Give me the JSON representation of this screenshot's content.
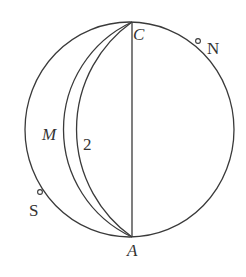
{
  "diagram": {
    "type": "sphere-great-circle-construction",
    "colors": {
      "line": "#3a3a3a",
      "text": "#333333",
      "background": "#ffffff"
    },
    "outer_circle": {
      "cx": 130,
      "cy": 129.5,
      "r": 106
    },
    "points": {
      "C": {
        "label": "C",
        "x": 132,
        "y": 22,
        "italic": true
      },
      "A": {
        "label": "A",
        "x": 132,
        "y": 237,
        "italic": true
      },
      "N": {
        "label": "N",
        "x": 198,
        "y": 41,
        "italic": false,
        "marker": "small-circle"
      },
      "S": {
        "label": "S",
        "x": 40,
        "y": 192,
        "italic": false,
        "marker": "small-circle"
      }
    },
    "segments": [
      {
        "name": "CA",
        "from": "C",
        "to": "A"
      }
    ],
    "arcs": [
      {
        "name": "arc-M",
        "label": "M",
        "from": "C",
        "to": "A",
        "radius": 118.6,
        "leftmost_x": 63.5
      },
      {
        "name": "arc-2",
        "label": "2",
        "from": "C",
        "to": "A",
        "radius": 131.9,
        "leftmost_x": 76.5
      }
    ],
    "labels": {
      "C": "C",
      "A": "A",
      "N": "N",
      "S": "S",
      "M": "M",
      "two": "2"
    }
  }
}
